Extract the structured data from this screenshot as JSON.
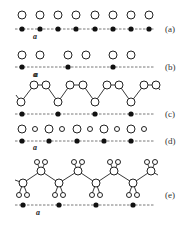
{
  "figure": {
    "panels": [
      {
        "id": "a",
        "label": "(a)",
        "lattice_label": "a",
        "description": "uniform chain of atoms above a 1D lattice with spacing a",
        "open_circles": [
          22,
          40,
          58,
          76,
          95,
          113,
          131,
          149
        ],
        "lattice_points": [
          22,
          40,
          58,
          76,
          95,
          113,
          131,
          149
        ]
      },
      {
        "id": "b",
        "label": "(b)",
        "lattice_label": "a",
        "description": "dimerized chain, pairs of atoms per lattice point",
        "open_circles": [
          22,
          40,
          68,
          86,
          113,
          131
        ],
        "lattice_points": [
          22,
          68,
          113
        ]
      },
      {
        "id": "c",
        "label": "(c)",
        "lattice_label": "a",
        "description": "zigzag chain with three atoms per unit cell",
        "lattice_points": [
          22,
          58,
          95,
          131
        ]
      },
      {
        "id": "d",
        "label": "(d)",
        "lattice_label": "a",
        "description": "alternating large and small atoms",
        "lattice_points": [
          22,
          49,
          77,
          104,
          131
        ]
      },
      {
        "id": "e",
        "label": "(e)",
        "lattice_label": "a",
        "description": "zigzag polymer backbone with side groups",
        "lattice_points": [
          23,
          59,
          96,
          133
        ]
      }
    ]
  }
}
